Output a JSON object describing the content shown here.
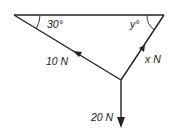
{
  "diagram": {
    "type": "force triangle",
    "labels": {
      "angle_left": "30°",
      "angle_right": "y°",
      "force_left": "10 N",
      "force_right": "x N",
      "force_down": "20 N"
    },
    "colors": {
      "line": "#222222",
      "background": "#ffffff"
    }
  }
}
